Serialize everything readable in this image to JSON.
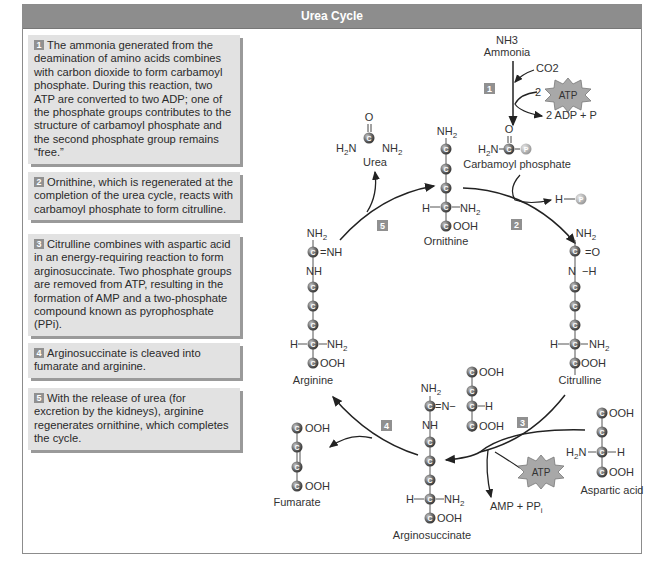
{
  "title": "Urea Cycle",
  "steps": [
    {
      "num": "1",
      "text": "The ammonia generated from the deamination of amino acids combines with carbon dioxide to form carbamoyl phosphate. During this reaction, two ATP are converted to two ADP; one of the phosphate groups contributes to the structure of carbamoyl phosphate and the second phosphate group remains “free.”"
    },
    {
      "num": "2",
      "text": "Ornithine, which is regenerated at the completion of the urea cycle, reacts with carbamoyl phosphate to form citrulline."
    },
    {
      "num": "3",
      "text": "Citrulline combines with aspartic acid in an energy-requiring reaction to form arginosuccinate. Two phosphate groups are removed from ATP, resulting in the formation of AMP and a two-phosphate compound known as pyrophosphate (PPi)."
    },
    {
      "num": "4",
      "text": "Arginosuccinate is cleaved into fumarate and arginine."
    },
    {
      "num": "5",
      "text": "With the release of urea (for excretion by the kidneys), arginine regenerates ornithine, which completes the cycle."
    }
  ],
  "diagram": {
    "molecules": {
      "ammonia": {
        "formula": "NH3",
        "label": "Ammonia"
      },
      "co2": "CO2",
      "atp": "ATP",
      "atp_count": "2",
      "adp_products": "2 ADP + P",
      "carbamoyl_phosphate": "Carbamoyl phosphate",
      "urea": "Urea",
      "ornithine": "Ornithine",
      "free_phosphate": "H—P",
      "citrulline": "Citrulline",
      "aspartic_acid": "Aspartic acid",
      "amp_ppi": "AMP + PPi",
      "arginosuccinate": "Arginosuccinate",
      "fumarate": "Fumarate",
      "arginine": "Arginine"
    },
    "step_markers": [
      "1",
      "2",
      "3",
      "4",
      "5"
    ],
    "colors": {
      "header": "#8d8d8d",
      "step_box": "#e2e2e2",
      "atp_burst": "#a8a8a8",
      "carbon_ball": "#6a6a6a",
      "phosphate_ball": "#b0b0b0"
    }
  }
}
